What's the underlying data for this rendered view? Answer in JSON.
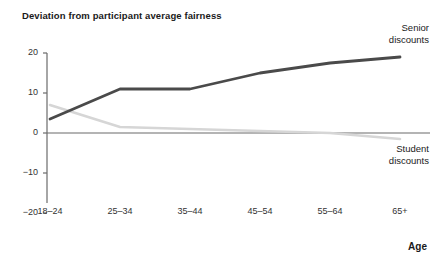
{
  "chart_data": {
    "type": "line",
    "title": "Deviation from participant average fairness",
    "xlabel": "Age",
    "ylabel": "",
    "categories": [
      "18–24",
      "25–34",
      "35–44",
      "45–54",
      "55–64",
      "65+"
    ],
    "ylim": [
      -20,
      20
    ],
    "yticks": [
      20,
      10,
      0,
      -10,
      -20
    ],
    "ytick_labels": [
      "20",
      "10",
      "0",
      "−10",
      "−20"
    ],
    "grid": false,
    "legend_position": "inline-right",
    "zero_line": true,
    "series": [
      {
        "name": "Senior discounts",
        "label_line1": "Senior",
        "label_line2": "discounts",
        "color": "#4a4a4a",
        "values": [
          3.5,
          11,
          11,
          15,
          17.5,
          19
        ]
      },
      {
        "name": "Student discounts",
        "label_line1": "Student",
        "label_line2": "discounts",
        "color": "#d6d6d6",
        "values": [
          7,
          1.5,
          1,
          0.5,
          0,
          -1.5
        ]
      }
    ]
  },
  "chart": {
    "title": "Deviation from participant average fairness",
    "xlabel": "Age",
    "ytick_labels": [
      "20",
      "10",
      "0",
      "−10",
      "−20"
    ],
    "xtick_labels": [
      "18–24",
      "25–34",
      "35–44",
      "45–54",
      "55–64",
      "65+"
    ],
    "senior_label_line1": "Senior",
    "senior_label_line2": "discounts",
    "student_label_line1": "Student",
    "student_label_line2": "discounts",
    "colors": {
      "senior": "#4a4a4a",
      "student": "#d6d6d6",
      "axis": "#6b6b6b",
      "zero_line": "#6b6b6b",
      "text": "#1a1a1a"
    }
  }
}
